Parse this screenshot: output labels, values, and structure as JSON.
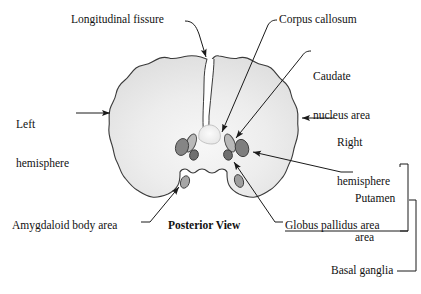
{
  "figure": {
    "title_caption": "Posterior View",
    "view_label": "Posterior View",
    "labels": {
      "longitudinal_fissure": "Longitudinal fissure",
      "corpus_callosum": "Corpus callosum",
      "caudate_nucleus_line1": "Caudate",
      "caudate_nucleus_line2": "nucleus area",
      "left_hemisphere_line1": "Left",
      "left_hemisphere_line2": "hemisphere",
      "right_hemisphere_line1": "Right",
      "right_hemisphere_line2": "hemisphere",
      "putamen_line1": "Putamen",
      "putamen_line2": "area",
      "globus_pallidus": "Globus pallidus area",
      "amygdaloid_body": "Amygdaloid body area",
      "basal_ganglia": "Basal ganglia"
    },
    "colors": {
      "background": "#ffffff",
      "text": "#111111",
      "outline": "#3a3a3a",
      "cortex_fill": "#e6e6e6",
      "cortex_fill_light": "#f2f2f2",
      "nucleus_dark": "#7d7d7d",
      "nucleus_mid": "#9a9a9a",
      "nucleus_light": "#c9c9c9",
      "corpus_callosum_fill": "#ededed",
      "leader_line": "#1a1a1a"
    },
    "bracket_groups": [
      {
        "name": "inner-bracket",
        "members": [
          "Putamen area",
          "Globus pallidus area"
        ]
      },
      {
        "name": "outer-bracket",
        "label": "Basal ganglia",
        "members": [
          "Caudate nucleus area",
          "Putamen area",
          "Globus pallidus area"
        ]
      }
    ],
    "structures": [
      {
        "name": "left-hemisphere",
        "type": "cortex"
      },
      {
        "name": "right-hemisphere",
        "type": "cortex"
      },
      {
        "name": "longitudinal-fissure",
        "type": "cleft"
      },
      {
        "name": "corpus-callosum",
        "type": "commissure"
      },
      {
        "name": "caudate-nucleus-left",
        "type": "nucleus"
      },
      {
        "name": "caudate-nucleus-right",
        "type": "nucleus"
      },
      {
        "name": "putamen-left",
        "type": "nucleus"
      },
      {
        "name": "putamen-right",
        "type": "nucleus"
      },
      {
        "name": "globus-pallidus-left",
        "type": "nucleus"
      },
      {
        "name": "globus-pallidus-right",
        "type": "nucleus"
      },
      {
        "name": "amygdaloid-body-left",
        "type": "nucleus"
      },
      {
        "name": "amygdaloid-body-right",
        "type": "nucleus"
      }
    ]
  }
}
